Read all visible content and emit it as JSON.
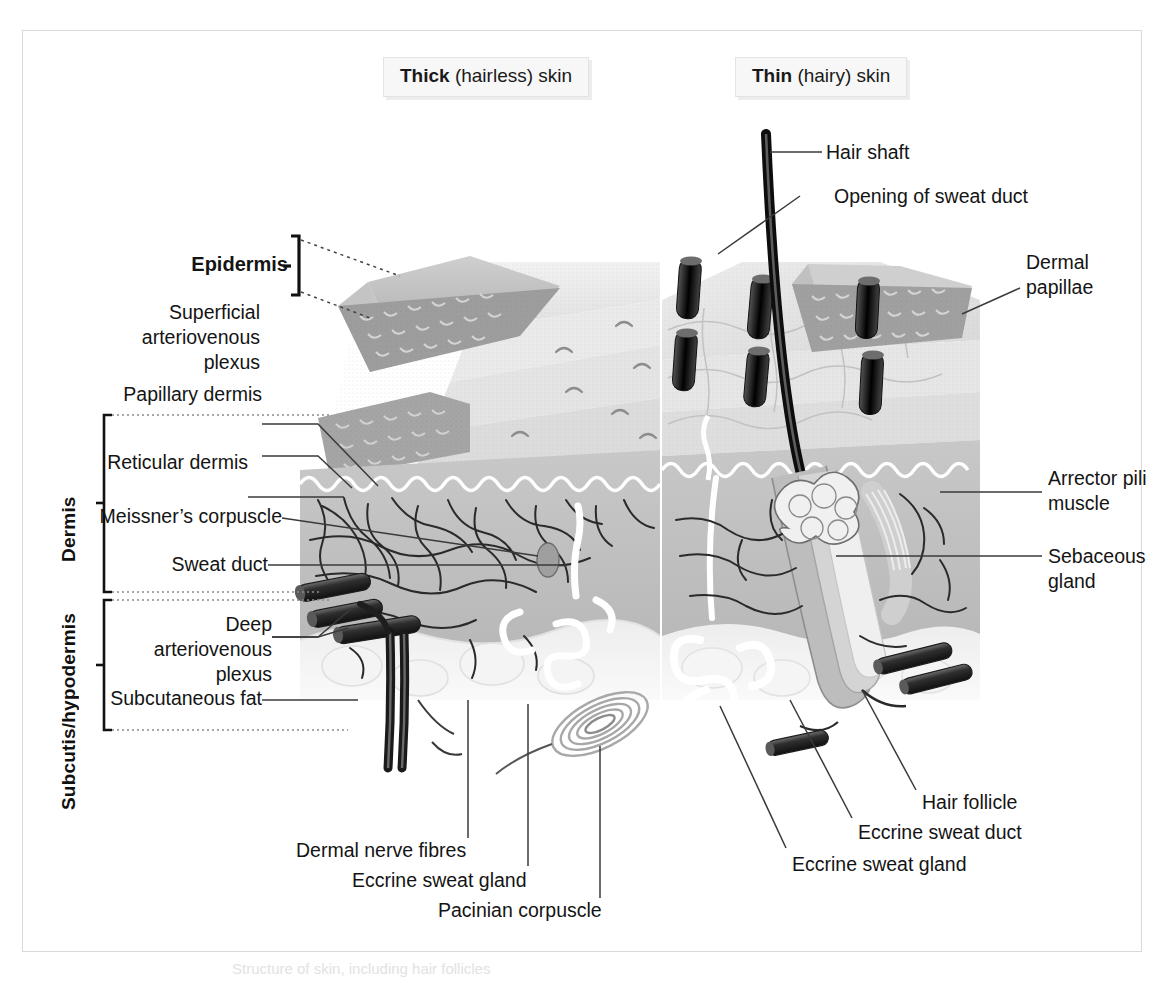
{
  "figure": {
    "background": "#ffffff",
    "frame_color": "#d9d9d9",
    "caption": "Structure of skin, including hair follicles"
  },
  "panels": [
    {
      "id": "thick",
      "title_bold": "Thick",
      "title_rest": " (hairless) skin"
    },
    {
      "id": "thin",
      "title_bold": "Thin",
      "title_rest": " (hairy) skin"
    }
  ],
  "regions": [
    {
      "id": "dermis",
      "label": "Dermis"
    },
    {
      "id": "subcutis",
      "label": "Subcutis/hypodermis"
    }
  ],
  "labels_left": [
    {
      "id": "epidermis",
      "text": "Epidermis",
      "bold": true
    },
    {
      "id": "superficial-plexus",
      "text": "Superficial\narteriovenous\nplexus"
    },
    {
      "id": "papillary-dermis",
      "text": "Papillary dermis"
    },
    {
      "id": "reticular-dermis",
      "text": "Reticular dermis"
    },
    {
      "id": "meissners-corpuscle",
      "text": "Meissner’s corpuscle"
    },
    {
      "id": "sweat-duct",
      "text": "Sweat duct"
    },
    {
      "id": "deep-plexus",
      "text": "Deep\narteriovenous\nplexus"
    },
    {
      "id": "subcutaneous-fat",
      "text": "Subcutaneous fat"
    }
  ],
  "labels_right": [
    {
      "id": "hair-shaft",
      "text": "Hair shaft"
    },
    {
      "id": "opening-of-sweat-duct",
      "text": "Opening of sweat duct"
    },
    {
      "id": "dermal-papillae",
      "text": "Dermal\npapillae"
    },
    {
      "id": "arrector-pili-muscle",
      "text": "Arrector pili\nmuscle"
    },
    {
      "id": "sebaceous-gland",
      "text": "Sebaceous\ngland"
    },
    {
      "id": "hair-follicle",
      "text": "Hair follicle"
    },
    {
      "id": "eccrine-sweat-duct",
      "text": "Eccrine sweat duct"
    },
    {
      "id": "eccrine-sweat-gland-r",
      "text": "Eccrine sweat gland"
    }
  ],
  "labels_bottom": [
    {
      "id": "dermal-nerve-fibres",
      "text": "Dermal nerve fibres"
    },
    {
      "id": "eccrine-sweat-gland-l",
      "text": "Eccrine sweat gland"
    },
    {
      "id": "pacinian-corpuscle",
      "text": "Pacinian corpuscle"
    }
  ]
}
